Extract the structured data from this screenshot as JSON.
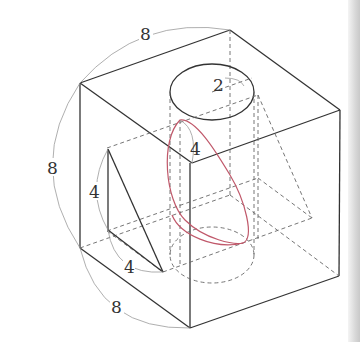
{
  "diagram": {
    "type": "3D geometry figure: cube with inscribed cylinder, triangle cut and elliptical section",
    "colors": {
      "edge": "#333333",
      "hidden_edge": "#666666",
      "dimension_arc": "#9a9a9a",
      "ellipse_section": "#c0586a",
      "background": "#ffffff"
    },
    "labels": {
      "cube_top_edge": "8",
      "cube_left_edge": "8",
      "cube_bottom_edge": "8",
      "cylinder_radius": "2",
      "section_height": "4",
      "triangle_vertical": "4",
      "triangle_bottom": "4"
    }
  }
}
